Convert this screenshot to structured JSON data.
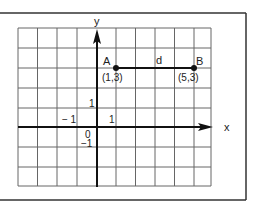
{
  "diagram": {
    "type": "coordinate-plane",
    "axes": {
      "x_label": "x",
      "y_label": "y"
    },
    "tick_labels": {
      "x_pos": "1",
      "x_neg": "− 1",
      "y_pos": "1",
      "y_neg": "−1",
      "origin": "0"
    },
    "points": [
      {
        "name": "A",
        "coord_label": "(1,3)",
        "x": 1,
        "y": 3
      },
      {
        "name": "B",
        "coord_label": "(5,3)",
        "x": 5,
        "y": 3
      }
    ],
    "segment_label": "d",
    "colors": {
      "line": "#111111",
      "grid": "#555555",
      "background": "#ffffff"
    }
  }
}
